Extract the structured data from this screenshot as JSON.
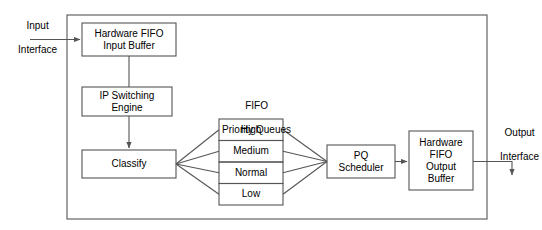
{
  "diagram": {
    "stroke_color": "#555555",
    "text_color": "#000000",
    "background": "#ffffff",
    "outer_frame": {
      "name": "device-boundary",
      "x": 67,
      "y": 15,
      "width": 420,
      "height": 204
    }
  },
  "external_labels": {
    "input": {
      "line1": "Input",
      "line2": "Interface"
    },
    "output": {
      "line1": "Output",
      "line2": "Interface"
    }
  },
  "group_label": {
    "line1": "FIFO",
    "line2": "Priority Queues"
  },
  "blocks": [
    {
      "id": "input-buffer",
      "line1": "Hardware FIFO",
      "line2": "Input Buffer",
      "x": 82,
      "y": 23,
      "width": 94,
      "height": 33
    },
    {
      "id": "switch-engine",
      "line1": "IP Switching",
      "line2": "Engine",
      "x": 82,
      "y": 87,
      "width": 90,
      "height": 29
    },
    {
      "id": "classify",
      "line1": "Classify",
      "line2": "",
      "x": 82,
      "y": 150,
      "width": 94,
      "height": 28
    },
    {
      "id": "pq-scheduler",
      "line1": "PQ",
      "line2": "Scheduler",
      "x": 327,
      "y": 145,
      "width": 68,
      "height": 33
    },
    {
      "id": "output-buffer",
      "line1": "Hardware",
      "line2": "FIFO",
      "line3": "Output",
      "line4": "Buffer",
      "x": 409,
      "y": 131,
      "width": 64,
      "height": 59
    }
  ],
  "priority_queues": {
    "x": 219,
    "y": 119,
    "width": 64,
    "row_height": 21.5,
    "rows": [
      {
        "id": "queue-high",
        "label": "High"
      },
      {
        "id": "queue-medium",
        "label": "Medium"
      },
      {
        "id": "queue-normal",
        "label": "Normal"
      },
      {
        "id": "queue-low",
        "label": "Low"
      }
    ]
  },
  "connections": [
    {
      "from": "input-interface",
      "to": "input-buffer",
      "type": "arrow"
    },
    {
      "from": "input-buffer",
      "to": "switch-engine",
      "type": "line"
    },
    {
      "from": "switch-engine",
      "to": "classify",
      "type": "arrow"
    },
    {
      "from": "classify",
      "to": "queue-high",
      "type": "line"
    },
    {
      "from": "classify",
      "to": "queue-medium",
      "type": "line"
    },
    {
      "from": "classify",
      "to": "queue-normal",
      "type": "line"
    },
    {
      "from": "classify",
      "to": "queue-low",
      "type": "line"
    },
    {
      "from": "queue-high",
      "to": "pq-scheduler",
      "type": "line"
    },
    {
      "from": "queue-medium",
      "to": "pq-scheduler",
      "type": "line"
    },
    {
      "from": "queue-normal",
      "to": "pq-scheduler",
      "type": "line"
    },
    {
      "from": "queue-low",
      "to": "pq-scheduler",
      "type": "line"
    },
    {
      "from": "pq-scheduler",
      "to": "output-buffer",
      "type": "arrow"
    },
    {
      "from": "output-buffer",
      "to": "output-interface",
      "type": "arrow"
    }
  ]
}
